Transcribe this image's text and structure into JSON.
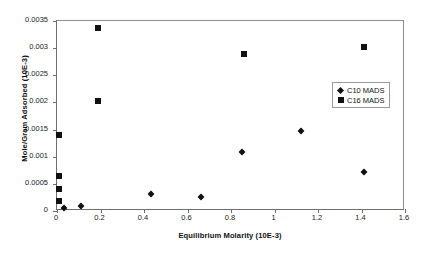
{
  "chart_data": {
    "type": "scatter",
    "title": "",
    "xlabel": "Equilibrium Molarity (10E-3)",
    "ylabel": "Mole/Gram Adsorbed (10E-3)",
    "xlim": [
      0,
      1.6
    ],
    "ylim": [
      0,
      0.0035
    ],
    "xticks": [
      "0",
      "0.2",
      "0.4",
      "0.6",
      "0.8",
      "1",
      "1.2",
      "1.4",
      "1.6"
    ],
    "xtick_values": [
      0,
      0.2,
      0.4,
      0.6,
      0.8,
      1.0,
      1.2,
      1.4,
      1.6
    ],
    "yticks": [
      "0",
      "0.0005",
      "0.001",
      "0.0015",
      "0.002",
      "0.0025",
      "0.003",
      "0.0035"
    ],
    "ytick_values": [
      0,
      0.0005,
      0.001,
      0.0015,
      0.002,
      0.0025,
      0.003,
      0.0035
    ],
    "grid": false,
    "legend_position": "right-inside",
    "series": [
      {
        "name": "C10 MADS",
        "marker": "diamond",
        "color": "#111111",
        "points": [
          {
            "x": 0.03,
            "y": 5e-05
          },
          {
            "x": 0.11,
            "y": 0.0001
          },
          {
            "x": 0.43,
            "y": 0.00032
          },
          {
            "x": 0.66,
            "y": 0.00026
          },
          {
            "x": 0.85,
            "y": 0.00108
          },
          {
            "x": 1.12,
            "y": 0.00147
          },
          {
            "x": 1.41,
            "y": 0.00072
          }
        ]
      },
      {
        "name": "C16 MADS",
        "marker": "square",
        "color": "#111111",
        "points": [
          {
            "x": 0.01,
            "y": 0.00018
          },
          {
            "x": 0.01,
            "y": 0.0004
          },
          {
            "x": 0.01,
            "y": 0.00065
          },
          {
            "x": 0.01,
            "y": 0.0014
          },
          {
            "x": 0.19,
            "y": 0.00202
          },
          {
            "x": 0.19,
            "y": 0.00337
          },
          {
            "x": 0.86,
            "y": 0.0029
          },
          {
            "x": 1.41,
            "y": 0.00303
          }
        ]
      }
    ]
  },
  "legend": {
    "entries": [
      {
        "label": "C10 MADS",
        "marker": "diamond"
      },
      {
        "label": "C16 MADS",
        "marker": "square"
      }
    ]
  }
}
